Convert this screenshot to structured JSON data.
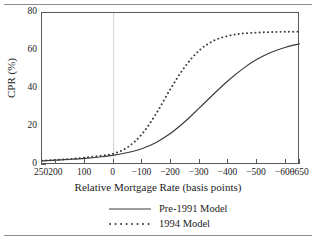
{
  "chart_data": {
    "type": "line",
    "title": "",
    "xlabel": "Relative Mortgage Rate (basis points)",
    "ylabel": "CPR (%)",
    "xlim": [
      250,
      -650
    ],
    "ylim": [
      0,
      80
    ],
    "x_ticks": [
      250,
      200,
      100,
      0,
      -100,
      -200,
      -300,
      -400,
      -500,
      -600,
      -650
    ],
    "x_tick_labels": [
      "250",
      "200",
      "100",
      "0",
      "−100",
      "−200",
      "−300",
      "−400",
      "−500",
      "−600",
      "−650"
    ],
    "y_ticks": [
      0,
      20,
      40,
      60,
      80
    ],
    "y_tick_labels": [
      "0",
      "20",
      "40",
      "60",
      "80"
    ],
    "grid": false,
    "reference_line_x": 0,
    "legend_position": "below",
    "series": [
      {
        "name": "Pre-1991 Model",
        "style": "solid",
        "color": "#3a3a3a",
        "x": [
          250,
          200,
          150,
          100,
          50,
          0,
          -50,
          -100,
          -150,
          -200,
          -250,
          -300,
          -350,
          -400,
          -450,
          -500,
          -550,
          -600,
          -650
        ],
        "y": [
          2.2,
          2.6,
          3.0,
          3.5,
          4.2,
          5.2,
          6.6,
          8.7,
          12.0,
          16.8,
          23.0,
          30.2,
          37.5,
          44.5,
          50.6,
          55.6,
          59.3,
          62.0,
          63.8
        ]
      },
      {
        "name": "1994 Model",
        "style": "dotted",
        "color": "#3a3a3a",
        "x": [
          250,
          200,
          150,
          100,
          50,
          0,
          -50,
          -100,
          -150,
          -200,
          -250,
          -300,
          -350,
          -400,
          -450,
          -500,
          -550,
          -600,
          -650
        ],
        "y": [
          2.3,
          2.7,
          3.2,
          3.9,
          4.8,
          6.0,
          9.5,
          16.5,
          27.5,
          40.5,
          52.0,
          60.5,
          65.5,
          68.0,
          69.2,
          69.7,
          70.0,
          70.1,
          70.2
        ]
      }
    ]
  },
  "legend": {
    "items": [
      {
        "label": "Pre-1991 Model",
        "style": "solid"
      },
      {
        "label": "1994 Model",
        "style": "dotted"
      }
    ]
  }
}
